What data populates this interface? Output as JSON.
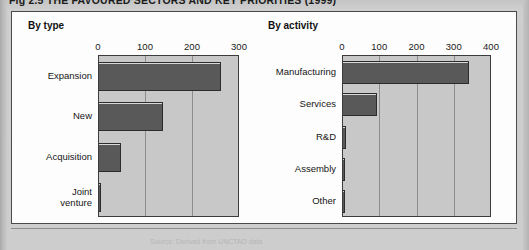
{
  "figure": {
    "title": "Fig 2.5  THE FAVOURED SECTORS AND KEY PRIORITIES (1999)",
    "source_note": "Source: Derived from UNCTAD data",
    "bar_color": "#595959",
    "plot_bg_color": "#c8c8c8",
    "frame_color": "#4a4a4a"
  },
  "chart_data": [
    {
      "type": "bar",
      "orientation": "horizontal",
      "title": "By type",
      "xlabel": "",
      "ylabel": "",
      "xlim": [
        0,
        300
      ],
      "ticks": [
        0,
        100,
        200,
        300
      ],
      "tick_labels": [
        "0",
        "100",
        "200",
        "300"
      ],
      "grid": true,
      "categories": [
        "Expansion",
        "New",
        "Acquisition",
        "Joint\nventure"
      ],
      "values": [
        262,
        139,
        48,
        5
      ]
    },
    {
      "type": "bar",
      "orientation": "horizontal",
      "title": "By activity",
      "xlabel": "",
      "ylabel": "",
      "xlim": [
        0,
        400
      ],
      "ticks": [
        0,
        100,
        200,
        300,
        400
      ],
      "tick_labels": [
        "0",
        "100",
        "200",
        "300",
        "400"
      ],
      "grid": true,
      "categories": [
        "Manufacturing",
        "Services",
        "R&D",
        "Assembly",
        "Other"
      ],
      "values": [
        340,
        95,
        12,
        9,
        3
      ]
    }
  ]
}
